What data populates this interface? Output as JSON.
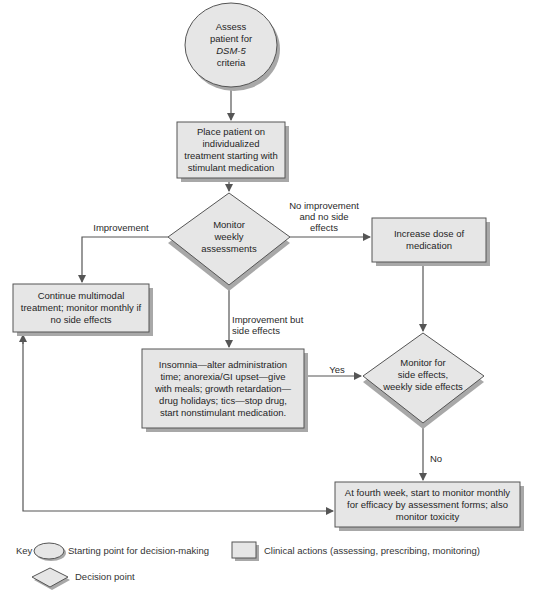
{
  "figure": {
    "colors": {
      "fill": "#e6e6e6",
      "stroke": "#555555",
      "shadow": "#a8a8a8",
      "line": "#555555",
      "background": "#ffffff"
    },
    "nodes": {
      "start": {
        "type": "ellipse",
        "lines": [
          "Assess",
          "patient for",
          "DSM-5",
          "criteria"
        ]
      },
      "place_patient": {
        "type": "action",
        "lines": [
          "Place patient on",
          "individualized",
          "treatment starting with",
          "stimulant medication"
        ]
      },
      "monitor_weekly": {
        "type": "decision",
        "lines": [
          "Monitor",
          "weekly",
          "assessments"
        ]
      },
      "continue_treatment": {
        "type": "action",
        "lines": [
          "Continue multimodal",
          "treatment; monitor monthly if",
          "no side effects"
        ]
      },
      "increase_dose": {
        "type": "action",
        "lines": [
          "Increase dose of",
          "medication"
        ]
      },
      "side_effects_mgmt": {
        "type": "action",
        "lines": [
          "Insomnia—alter administration",
          "time; anorexia/GI upset—give",
          "with meals; growth retardation—",
          "drug holidays; tics—stop drug,",
          "start nonstimulant medication."
        ]
      },
      "monitor_side_effects": {
        "type": "decision",
        "lines": [
          "Monitor for",
          "side effects,",
          "weekly side effects"
        ]
      },
      "fourth_week": {
        "type": "action",
        "lines": [
          "At fourth week, start to monitor monthly",
          "for efficacy by assessment forms; also",
          "monitor toxicity"
        ]
      }
    },
    "edge_labels": {
      "improvement": "Improvement",
      "no_improvement": [
        "No improvement",
        "and no side",
        "effects"
      ],
      "improvement_side_effects": [
        "Improvement but",
        "side effects"
      ],
      "yes": "Yes",
      "no": "No"
    },
    "key": {
      "title": "Key",
      "ellipse": "Starting point for decision-making",
      "rectangle": "Clinical actions (assessing, prescribing, monitoring)",
      "diamond": "Decision point"
    }
  }
}
